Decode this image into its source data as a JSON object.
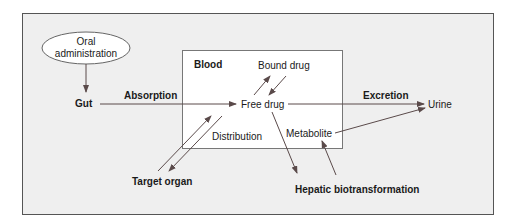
{
  "diagram": {
    "colors": {
      "page_bg": "#ffffff",
      "frame_bg": "#efefef",
      "frame_border": "#555555",
      "blood_box_bg": "#ffffff",
      "blood_box_border": "#777777",
      "ellipse_bg": "#ffffff",
      "arrow": "#5a4a4a",
      "text": "#1a1a1a"
    },
    "nodes": {
      "oral_line1": "Oral",
      "oral_line2": "administration",
      "gut": "Gut",
      "blood": "Blood",
      "bound_drug": "Bound drug",
      "free_drug": "Free drug",
      "metabolite": "Metabolite",
      "urine": "Urine",
      "target_organ": "Target organ",
      "hepatic": "Hepatic biotransformation"
    },
    "edge_labels": {
      "absorption": "Absorption",
      "excretion": "Excretion",
      "distribution": "Distribution"
    }
  }
}
